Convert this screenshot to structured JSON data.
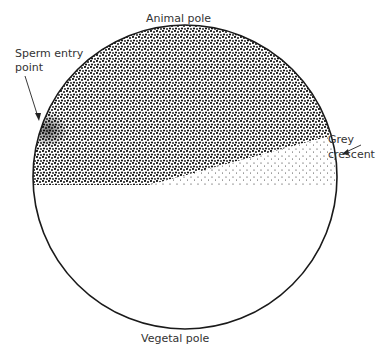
{
  "diagram": {
    "labels": {
      "animal_pole": "Animal pole",
      "vegetal_pole": "Vegetal pole",
      "sperm_entry_line1": "Sperm entry",
      "sperm_entry_line2": "point",
      "grey_crescent_line1": "Grey",
      "grey_crescent_line2": "crescent"
    },
    "colors": {
      "outline": "#1a1a1a",
      "stipple_dark": "#111111",
      "background": "#ffffff"
    }
  }
}
